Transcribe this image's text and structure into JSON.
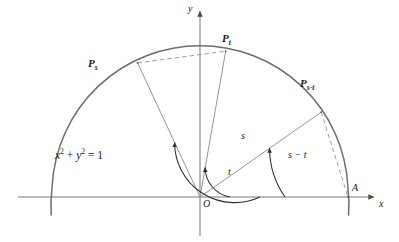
{
  "figure": {
    "type": "unit-circle-angle-diagram",
    "equation": {
      "lhs_x": "x",
      "sup2a": "2",
      "plus": "+",
      "lhs_y": "y",
      "sup2b": "2",
      "eq": "=",
      "rhs": "1",
      "full": "x² + y² = 1"
    },
    "axes": {
      "x_label": "x",
      "y_label": "y",
      "origin_label": "O"
    },
    "points": [
      {
        "id": "Ps",
        "base": "P",
        "subscript": "s",
        "label": "P_s",
        "angle_deg": 115,
        "x": 137.5,
        "y": 62.9
      },
      {
        "id": "Pt",
        "base": "P",
        "subscript": "t",
        "label": "P_t",
        "angle_deg": 80,
        "x": 225.7,
        "y": 51.2
      },
      {
        "id": "Pst",
        "base": "P",
        "subscript": "s-t",
        "label": "P_s-t",
        "angle_deg": 35,
        "x": 321.2,
        "y": 112.1
      },
      {
        "id": "A",
        "base": "A",
        "subscript": "",
        "label": "A",
        "angle_deg": 0,
        "x": 348.0,
        "y": 197.0
      }
    ],
    "angles": [
      {
        "id": "t",
        "label": "t",
        "from_deg": 0,
        "to_deg": 80,
        "arc_radius": 30
      },
      {
        "id": "s",
        "label": "s",
        "from_deg": 0,
        "to_deg": 115,
        "arc_radius": 60
      },
      {
        "id": "smt",
        "label": "s − t",
        "from_deg": 0,
        "to_deg": 35,
        "arc_radius": 85
      }
    ],
    "chords": [
      {
        "id": "chord-ps-pt",
        "from": "Ps",
        "to": "Pt",
        "style": "dashed"
      },
      {
        "id": "chord-pst-a",
        "from": "Pst",
        "to": "A",
        "style": "dashed"
      }
    ],
    "circle": {
      "center_x": 200,
      "center_y": 197,
      "radius": 148
    },
    "colors": {
      "ink": "#1b1b1b",
      "circle_stroke": "#6e6e6e",
      "ray_stroke": "#8f8f8f",
      "axis_stroke": "#7a7a7a",
      "dash_stroke": "#9a9a9a",
      "background": "#ffffff"
    }
  }
}
